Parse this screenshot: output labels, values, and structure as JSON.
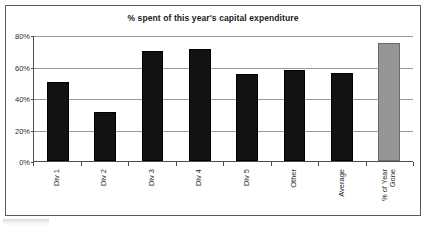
{
  "chart_data": {
    "type": "bar",
    "title": "% spent of this year's capital expenditure",
    "xlabel": "",
    "ylabel": "",
    "categories": [
      "Div 1",
      "Div 2",
      "Div 3",
      "Div 4",
      "Div 5",
      "Other",
      "Average",
      "% of Year Gone"
    ],
    "values": [
      50,
      31,
      70,
      71,
      55,
      58,
      56,
      75
    ],
    "ylim": [
      0,
      80
    ],
    "ytick_labels": [
      "0%",
      "20%",
      "40%",
      "60%",
      "80%"
    ],
    "ytick_values": [
      0,
      20,
      40,
      60,
      80
    ],
    "grid": true,
    "legend": false,
    "series": [
      {
        "name": "% spent",
        "values": [
          50,
          31,
          70,
          71,
          55,
          58,
          56,
          75
        ]
      }
    ],
    "bar_colors": [
      "#111111",
      "#111111",
      "#111111",
      "#111111",
      "#111111",
      "#111111",
      "#111111",
      "#969696"
    ],
    "highlight_index": 7,
    "colors": {
      "bar_default": "#111111",
      "bar_highlight": "#969696",
      "gridline": "#9a9a9a",
      "axis": "#4d4d4d",
      "frame": "#5a5a5a",
      "text": "#1a1a1a",
      "background": "#ffffff"
    }
  },
  "x_axis_label_lines": [
    [
      "Div 1"
    ],
    [
      "Div 2"
    ],
    [
      "Div 3"
    ],
    [
      "Div 4"
    ],
    [
      "Div 5"
    ],
    [
      "Other"
    ],
    [
      "Average"
    ],
    [
      "% of Year",
      "Gone"
    ]
  ]
}
